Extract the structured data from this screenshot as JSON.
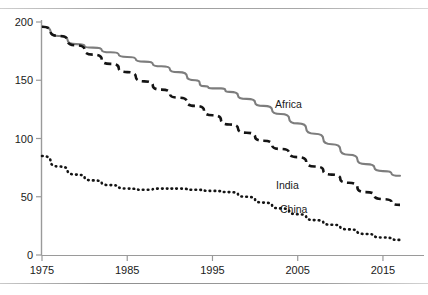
{
  "figure": {
    "top_fragment": "",
    "rules": {
      "top_label": "top-horizontal-rule",
      "bottom_label": "bottom-horizontal-rule"
    }
  },
  "axes": {
    "y_ticks": [
      "0",
      "50",
      "100",
      "150",
      "200"
    ],
    "x_ticks": [
      "1975",
      "1985",
      "1995",
      "2005",
      "2015"
    ]
  },
  "series_labels": {
    "africa": "Africa",
    "india": "India",
    "china": "China"
  },
  "chart_data": {
    "type": "line",
    "title": "",
    "xlabel": "",
    "ylabel": "",
    "xlim": [
      1975,
      2017
    ],
    "ylim": [
      0,
      200
    ],
    "grid": false,
    "legend": "inline-labels",
    "yticks": [
      0,
      50,
      100,
      150,
      200
    ],
    "xticks": [
      1975,
      1985,
      1995,
      2005,
      2015
    ],
    "colors": {
      "africa": "#808080",
      "india": "#111111",
      "china": "#111111"
    },
    "linestyles": {
      "africa": "solid",
      "india": "dashed",
      "china": "dotted"
    },
    "series": [
      {
        "name": "Africa",
        "x": [
          1975,
          1977,
          1979,
          1981,
          1983,
          1985,
          1987,
          1989,
          1991,
          1993,
          1994,
          1995,
          1996,
          1997,
          1999,
          2001,
          2003,
          2005,
          2007,
          2009,
          2011,
          2013,
          2015,
          2017
        ],
        "values": [
          196,
          188,
          181,
          178,
          174,
          170,
          166,
          162,
          157,
          150,
          145,
          143,
          143,
          140,
          134,
          128,
          121,
          113,
          104,
          95,
          86,
          78,
          72,
          68
        ]
      },
      {
        "name": "India",
        "x": [
          1975,
          1977,
          1979,
          1981,
          1983,
          1985,
          1987,
          1989,
          1991,
          1993,
          1995,
          1997,
          1999,
          2001,
          2003,
          2005,
          2007,
          2009,
          2011,
          2013,
          2015,
          2017
        ],
        "values": [
          196,
          188,
          180,
          172,
          164,
          157,
          149,
          142,
          135,
          128,
          120,
          112,
          105,
          98,
          91,
          84,
          76,
          69,
          62,
          54,
          48,
          43
        ]
      },
      {
        "name": "China",
        "x": [
          1975,
          1977,
          1979,
          1981,
          1983,
          1985,
          1987,
          1989,
          1991,
          1993,
          1995,
          1997,
          1999,
          2001,
          2003,
          2005,
          2007,
          2009,
          2011,
          2013,
          2015,
          2017
        ],
        "values": [
          85,
          76,
          69,
          64,
          60,
          57,
          56,
          57,
          57,
          56,
          55,
          54,
          50,
          45,
          40,
          35,
          30,
          26,
          22,
          18,
          15,
          13
        ]
      }
    ]
  }
}
